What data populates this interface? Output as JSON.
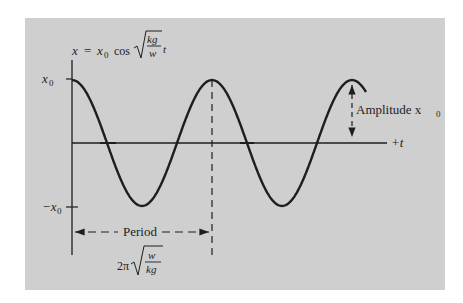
{
  "figure": {
    "equation": {
      "lhs": "x",
      "equals": "=",
      "coef": "x",
      "coef_sub": "0",
      "func": "cos",
      "sqrt_num": "kg",
      "sqrt_den": "w",
      "var": "t"
    },
    "y_labels": {
      "top": "x",
      "top_sub": "0",
      "bottom": "−x",
      "bottom_sub": "0"
    },
    "t_axis_label": "+t",
    "amplitude_label": "Amplitude x",
    "amplitude_sub": "0",
    "period_label": "Period",
    "period_formula": {
      "prefix": "2π",
      "sqrt_num": "w",
      "sqrt_den": "kg"
    },
    "colors": {
      "background": "#cfcfcf",
      "ink": "#1e1e1e"
    }
  },
  "chart_data": {
    "type": "line",
    "xlabel": "+t",
    "ylabel": "x",
    "function": "x0 * cos(2π t / T)",
    "amplitude": "x0",
    "period": "2π √(w/kg)",
    "x_range_periods": [
      0,
      2.1
    ],
    "y_ticks": [
      "x0",
      "-x0"
    ],
    "annotations": [
      "Amplitude x0",
      "Period",
      "2π√(w/kg)"
    ],
    "grid": false
  }
}
